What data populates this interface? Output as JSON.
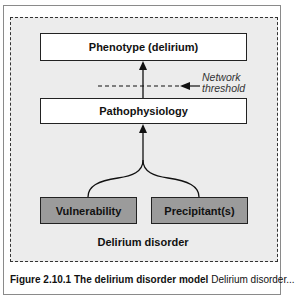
{
  "diagram": {
    "nodes": {
      "phenotype": "Phenotype (delirium)",
      "pathophysiology": "Pathophysiology",
      "vulnerability": "Vulnerability",
      "precipitants": "Precipitant(s)"
    },
    "threshold_label_line1": "Network",
    "threshold_label_line2": "threshold",
    "container_label": "Delirium disorder",
    "edges": [
      {
        "from": "vulnerability",
        "to": "pathophysiology"
      },
      {
        "from": "precipitants",
        "to": "pathophysiology"
      },
      {
        "from": "pathophysiology",
        "to": "phenotype"
      }
    ],
    "colors": {
      "container_bg": "#ececec",
      "input_box_fill": "#9b9b9b",
      "output_box_fill": "#ffffff"
    }
  },
  "caption": {
    "title": "Figure 2.10.1 The delirium disorder model",
    "text": "Delirium disorder..."
  }
}
